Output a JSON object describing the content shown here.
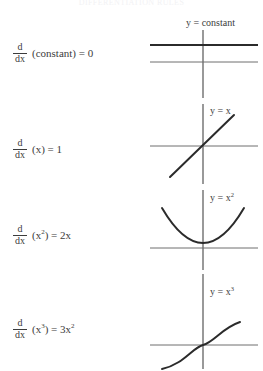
{
  "heading": "DIFFERENTIATION RULES",
  "rows": [
    {
      "formula": {
        "numerator": "d",
        "denominator": "dx",
        "body": "(constant) = 0"
      },
      "graph": {
        "label": "y = constant",
        "curve": "horizontal-constant-line"
      }
    },
    {
      "formula": {
        "numerator": "d",
        "denominator": "dx",
        "body": "(x) = 1"
      },
      "graph": {
        "label": "y = x",
        "curve": "diagonal-line"
      }
    },
    {
      "formula": {
        "numerator": "d",
        "denominator": "dx",
        "body_prefix": "(x",
        "body_exponent": "2",
        "body_suffix": ") = 2x"
      },
      "graph": {
        "label_prefix": "y = x",
        "label_exponent": "2",
        "curve": "parabola"
      }
    },
    {
      "formula": {
        "numerator": "d",
        "denominator": "dx",
        "body_prefix": "(x",
        "body_exponent": "3",
        "body_suffix": ") = 3x",
        "result_exponent": "2"
      },
      "graph": {
        "label_prefix": "y = x",
        "label_exponent": "3",
        "curve": "cubic"
      }
    }
  ],
  "colors": {
    "curve": "#2b2b2b",
    "axis": "#6e6e6e",
    "text": "#3c3c3c"
  }
}
